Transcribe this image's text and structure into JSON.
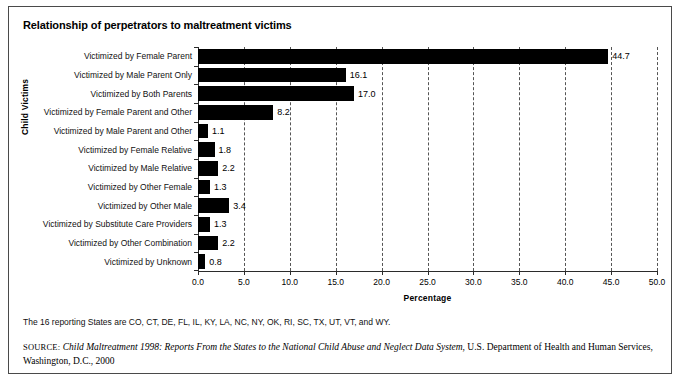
{
  "chart_data": {
    "type": "bar",
    "orientation": "horizontal",
    "title": "Relationship of perpetrators to maltreatment victims",
    "xlabel": "Percentage",
    "ylabel": "Child Victims",
    "xlim": [
      0.0,
      50.0
    ],
    "xticks": [
      "0.0",
      "5.0",
      "10.0",
      "15.0",
      "20.0",
      "25.0",
      "30.0",
      "35.0",
      "40.0",
      "45.0",
      "50.0"
    ],
    "xtick_values": [
      0,
      5,
      10,
      15,
      20,
      25,
      30,
      35,
      40,
      45,
      50
    ],
    "grid": "vertical-dashed",
    "legend": "none",
    "bar_color": "#000000",
    "categories": [
      "Victimized by Female Parent",
      "Victimized by Male Parent Only",
      "Victimized by Both Parents",
      "Victimized by Female Parent and Other",
      "Victimized by Male Parent and Other",
      "Victimized by Female Relative",
      "Victimized by Male Relative",
      "Victimized by Other Female",
      "Victimized by Other Male",
      "Victimized by Substitute Care Providers",
      "Victimized by Other Combination",
      "Victimized by Unknown"
    ],
    "values": [
      44.7,
      16.1,
      17.0,
      8.2,
      1.1,
      1.8,
      2.2,
      1.3,
      3.4,
      1.3,
      2.2,
      0.8
    ],
    "value_labels": [
      "44.7",
      "16.1",
      "17.0",
      "8.2",
      "1.1",
      "1.8",
      "2.2",
      "1.3",
      "3.4",
      "1.3",
      "2.2",
      "0.8"
    ]
  },
  "footnote": "The 16 reporting States are CO, CT, DE, FL, IL, KY, LA, NC, NY, OK, RI, SC, TX, UT, VT, and WY.",
  "source": {
    "label": "SOURCE:",
    "title": "Child Maltreatment 1998: Reports From the States to the National Child Abuse and Neglect Data System",
    "rest": ", U.S. Department of Health and Human Services, Washington, D.C., 2000"
  }
}
